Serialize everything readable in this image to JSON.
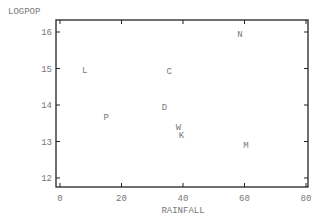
{
  "chart_data": {
    "type": "scatter",
    "title": "",
    "xlabel": "RAINFALL",
    "ylabel": "LOGPOP",
    "xlim": [
      0,
      80
    ],
    "ylim": [
      11.8,
      16.3
    ],
    "xticks": [
      0,
      20,
      40,
      60,
      80
    ],
    "yticks": [
      12,
      13,
      14,
      15,
      16
    ],
    "grid": false,
    "legend": null,
    "points": [
      {
        "label": "N",
        "x": 58.5,
        "y": 15.95
      },
      {
        "label": "L",
        "x": 8,
        "y": 14.97
      },
      {
        "label": "C",
        "x": 35.5,
        "y": 14.93
      },
      {
        "label": "D",
        "x": 34,
        "y": 13.95
      },
      {
        "label": "P",
        "x": 15,
        "y": 13.67
      },
      {
        "label": "W",
        "x": 38.5,
        "y": 13.4
      },
      {
        "label": "K",
        "x": 39.5,
        "y": 13.18
      },
      {
        "label": "M",
        "x": 60.5,
        "y": 12.9
      }
    ]
  },
  "colors": {
    "axis": "#222222",
    "text": "#777777"
  }
}
